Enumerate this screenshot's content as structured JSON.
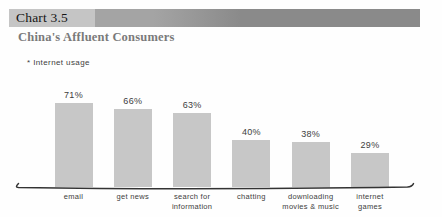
{
  "header": {
    "chart_label": "Chart 3.5",
    "title": "China's Affluent Consumers",
    "note": "* Internet usage"
  },
  "colors": {
    "background": "#fefefe",
    "header_box": "#c5c5c5",
    "header_bar_start": "#a4a4a4",
    "header_bar_end": "#8a8a8a",
    "title_text": "#7a7a7a",
    "bar_fill": "#c7c7c7",
    "label_text": "#3d3d3d",
    "axis_line": "#333333"
  },
  "chart_data": {
    "type": "bar",
    "title": "China's Affluent Consumers",
    "note": "* Internet usage",
    "categories": [
      "email",
      "get news",
      "search for\ninformation",
      "chatting",
      "downloading\nmovies & music",
      "internet\ngames"
    ],
    "values": [
      71,
      66,
      63,
      40,
      38,
      29
    ],
    "value_labels": [
      "71%",
      "66%",
      "63%",
      "40%",
      "38%",
      "29%"
    ],
    "unit": "percent",
    "ylim": [
      0,
      100
    ],
    "grid": false,
    "legend": "none"
  }
}
